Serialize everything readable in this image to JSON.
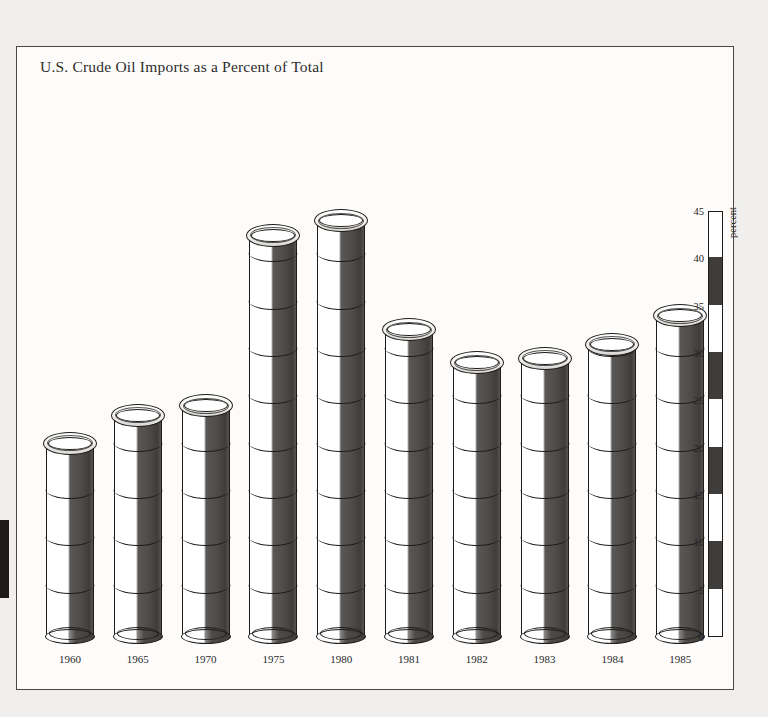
{
  "chart_data": {
    "type": "bar",
    "title": "U.S. Crude Oil Imports as a Percent of Total",
    "xlabel": "",
    "ylabel": "percent",
    "ylim": [
      0,
      45
    ],
    "grid": false,
    "legend": "none",
    "tick_labels": [
      "0",
      "5",
      "10",
      "15",
      "20",
      "25",
      "30",
      "35",
      "40",
      "45"
    ],
    "tick_values": [
      0,
      5,
      10,
      15,
      20,
      25,
      30,
      35,
      40,
      45
    ],
    "categories": [
      "1960",
      "1965",
      "1970",
      "1975",
      "1980",
      "1981",
      "1982",
      "1983",
      "1984",
      "1985"
    ],
    "values": [
      20.5,
      23.5,
      24.5,
      42.5,
      44.0,
      32.5,
      29.0,
      29.5,
      31.0,
      34.0
    ],
    "annotations": []
  },
  "axis": {
    "caption": "percent"
  },
  "page": {
    "frame_border_color": "#4a4846",
    "background_color": "#f1efed",
    "plot_background_color": "#fdfcfb",
    "bar_dark_color": "#3f3d3c",
    "bar_light_color": "#ffffff",
    "ink_color": "#1d1c1b"
  }
}
